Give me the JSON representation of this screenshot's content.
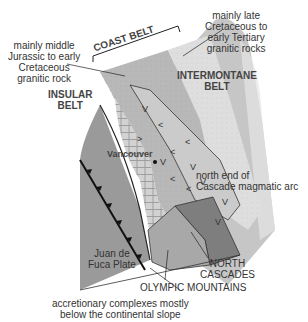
{
  "labels": {
    "coast_belt": "COAST BELT",
    "insular_belt": [
      "INSULAR",
      "BELT"
    ],
    "intermontane_belt": [
      "INTERMONTANE",
      "BELT"
    ],
    "middle_jurassic": [
      "mainly middle",
      "Jurassic to early",
      "Cretaceous",
      "granitic rock"
    ],
    "late_cretaceous": [
      "mainly late",
      "Cretaceous to",
      "early Tertiary",
      "granitic rocks"
    ],
    "vancouver": "Vancouver",
    "cascade_arc": [
      "north end of",
      "Cascade magmatic arc"
    ],
    "juan_de_fuca": [
      "Juan de",
      "Fuca Plate"
    ],
    "north_cascades": [
      "NORTH",
      "CASCADES"
    ],
    "olympic_mountains": "OLYMPIC MOUNTAINS",
    "accretionary": [
      "accretionary complexes mostly",
      "below the continental slope"
    ]
  },
  "colors": {
    "ocean_plate": "#9a9a9a",
    "insular": "#c9c9c9",
    "coast_middle": "#b4b4b4",
    "coast_late": "#dcdcdc",
    "intermontane": "#c4c4c4",
    "north_cascades": "#7e7e7e",
    "olympic": "#a8a8a8",
    "line": "#222222"
  },
  "symbols": {
    "volcanic_arc": "V",
    "city_marker": "dot",
    "subduction_teeth": "triangle"
  }
}
